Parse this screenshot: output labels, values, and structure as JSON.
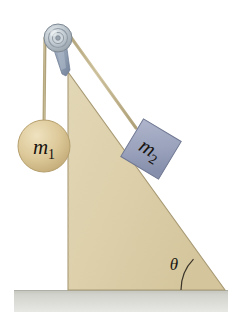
{
  "figure": {
    "type": "physics-diagram",
    "labels": {
      "mass1_symbol": "m",
      "mass1_subscript": "1",
      "mass2_symbol": "m",
      "mass2_subscript": "2",
      "angle_symbol": "θ"
    },
    "colors": {
      "incline_fill": "#ddd0ab",
      "incline_edge": "#a89a74",
      "ground_fill": "#cdcec7",
      "ground_edge": "#aeb0a8",
      "ball_fill": "#ddc99a",
      "ball_edge": "#b59f6d",
      "block_fill": "#9ba3bd",
      "block_edge": "#6f7792",
      "rope": "#c8bc9a",
      "pulley_metal": "#b9c2c8",
      "bracket": "#8e9cb0",
      "text": "#17130f"
    },
    "geometry": {
      "incline_apex": [
        68,
        72
      ],
      "incline_base_left": [
        68,
        290
      ],
      "incline_base_right": [
        225,
        290
      ],
      "pulley_center": [
        58,
        38
      ],
      "pulley_radius": 14,
      "ball_center": [
        44,
        146
      ],
      "ball_radius": 26,
      "block_center": [
        151,
        149
      ],
      "block_size": 44,
      "block_rotation_deg": 30,
      "ground_top": 290,
      "ground_bottom": 312,
      "angle_vertex": [
        225,
        290
      ],
      "angle_arc_radius": 44
    }
  }
}
